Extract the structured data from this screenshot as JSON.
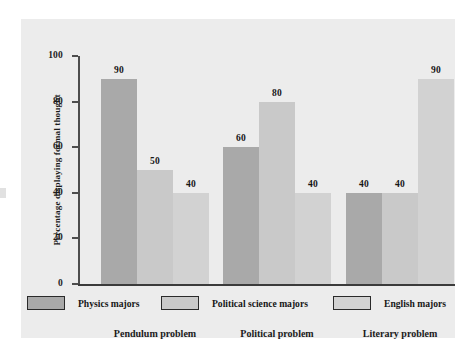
{
  "figure": {
    "background_color": "#ececec",
    "page_color": "#ffffff"
  },
  "chart_data": {
    "type": "bar",
    "title": "",
    "xlabel": "",
    "ylabel": "Percentage displaying formal thought",
    "ylim": [
      0,
      100
    ],
    "yticks": [
      0,
      20,
      40,
      60,
      80,
      100
    ],
    "ytick_labels": [
      "0",
      "20",
      "40",
      "60",
      "80",
      "100"
    ],
    "grid": false,
    "legend_position": "bottom",
    "categories": [
      "Pendulum problem",
      "Political problem",
      "Literary problem"
    ],
    "series": [
      {
        "name": "Physics majors",
        "color": "#a9a9a9",
        "values": [
          90,
          60,
          40
        ],
        "value_labels": [
          "90",
          "60",
          "40"
        ]
      },
      {
        "name": "Political science majors",
        "color": "#c9c9c9",
        "values": [
          50,
          80,
          40
        ],
        "value_labels": [
          "50",
          "80",
          "40"
        ]
      },
      {
        "name": "English majors",
        "color": "#d2d2d2",
        "values": [
          40,
          40,
          90
        ],
        "value_labels": [
          "40",
          "40",
          "90"
        ]
      }
    ]
  },
  "axes": {
    "tick_0": "0",
    "tick_20": "20",
    "tick_40": "40",
    "tick_60": "60",
    "tick_80": "80",
    "tick_100": "100",
    "y_title": "Percentage displaying formal thought"
  },
  "groups": [
    {
      "label": "Pendulum problem",
      "bars": [
        {
          "series": "Physics majors",
          "value": 90,
          "label": "90",
          "color": "#a9a9a9"
        },
        {
          "series": "Political science majors",
          "value": 50,
          "label": "50",
          "color": "#c9c9c9"
        },
        {
          "series": "English majors",
          "value": 40,
          "label": "40",
          "color": "#d2d2d2"
        }
      ]
    },
    {
      "label": "Political problem",
      "bars": [
        {
          "series": "Physics majors",
          "value": 60,
          "label": "60",
          "color": "#a9a9a9"
        },
        {
          "series": "Political science majors",
          "value": 80,
          "label": "80",
          "color": "#c9c9c9"
        },
        {
          "series": "English majors",
          "value": 40,
          "label": "40",
          "color": "#d2d2d2"
        }
      ]
    },
    {
      "label": "Literary problem",
      "bars": [
        {
          "series": "Physics majors",
          "value": 40,
          "label": "40",
          "color": "#a9a9a9"
        },
        {
          "series": "Political science majors",
          "value": 40,
          "label": "40",
          "color": "#c9c9c9"
        },
        {
          "series": "English majors",
          "value": 90,
          "label": "90",
          "color": "#d2d2d2"
        }
      ]
    }
  ],
  "legend": {
    "items": [
      {
        "label": "Physics majors",
        "color": "#a9a9a9"
      },
      {
        "label": "Political science majors",
        "color": "#c9c9c9"
      },
      {
        "label": "English majors",
        "color": "#d2d2d2"
      }
    ]
  }
}
